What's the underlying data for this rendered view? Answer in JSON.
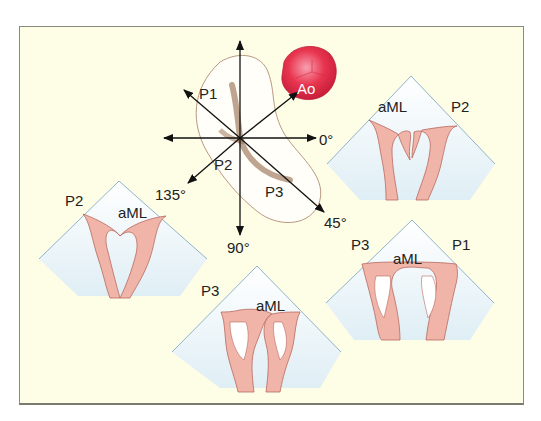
{
  "figure": {
    "colors": {
      "background": "#fefde6",
      "frame_border": "#8a8a80",
      "view_fill": "#e6f2f6",
      "view_line": "#8fb4cc",
      "tissue": "#f0b4a8",
      "tissue_line": "#b86a60",
      "aorta": "#e8354f",
      "valve_fill": "#ffffff",
      "valve_shadow": "#7a4a30"
    },
    "center_diagram": {
      "aorta_label": "Ao",
      "scallop_labels": [
        "P1",
        "P2",
        "P3"
      ],
      "angle_labels": {
        "a0": "0°",
        "a45": "45°",
        "a90": "90°",
        "a135": "135°"
      }
    },
    "views": [
      {
        "id": "view-0deg",
        "left_label": "aML",
        "right_label": "P2"
      },
      {
        "id": "view-135deg",
        "left_label": "P2",
        "right_label": "aML"
      },
      {
        "id": "view-45deg",
        "left_label": "P3",
        "center_label": "aML",
        "right_label": "P1"
      },
      {
        "id": "view-90deg",
        "left_label": "P3",
        "right_label": "aML"
      }
    ]
  }
}
